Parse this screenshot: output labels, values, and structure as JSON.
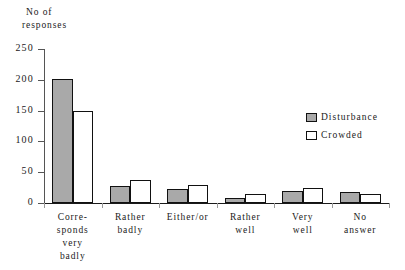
{
  "chart_data": {
    "type": "bar",
    "title": "",
    "subtitle": "",
    "xlabel": "",
    "ylabel": "No of responses",
    "ylabel_lines": [
      "No of",
      "responses"
    ],
    "ylim": [
      0,
      250
    ],
    "yticks": [
      0,
      50,
      100,
      150,
      200,
      250
    ],
    "ytick_labels": [
      "0",
      "50",
      "100",
      "150",
      "200",
      "250"
    ],
    "grid": false,
    "legend_position": "center-right",
    "categories": [
      "Corresponds very badly",
      "Rather badly",
      "Either/or",
      "Rather well",
      "Very well",
      "No answer"
    ],
    "category_label_lines": [
      [
        "Corre-",
        "sponds",
        "very",
        "badly"
      ],
      [
        "Rather",
        "badly"
      ],
      [
        "Either/or"
      ],
      [
        "Rather",
        "well"
      ],
      [
        "Very",
        "well"
      ],
      [
        "No",
        "answer"
      ]
    ],
    "series": [
      {
        "name": "Disturbance",
        "color": "#a9a9a9",
        "values": [
          202,
          27,
          23,
          8,
          19,
          18
        ]
      },
      {
        "name": "Crowded",
        "color": "#ffffff",
        "values": [
          150,
          38,
          30,
          14,
          24,
          14
        ]
      }
    ]
  },
  "legend": {
    "items": [
      {
        "label": "Disturbance",
        "swatch": "series-a"
      },
      {
        "label": "Crowded",
        "swatch": "series-b"
      }
    ]
  }
}
